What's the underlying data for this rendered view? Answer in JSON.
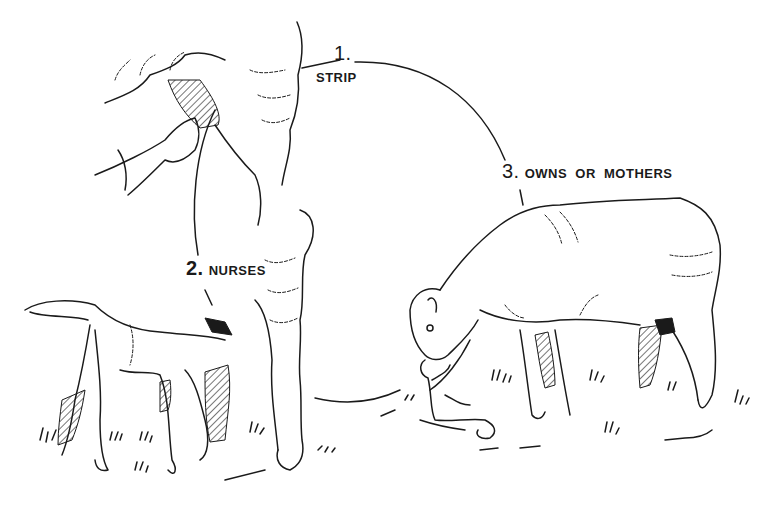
{
  "diagram": {
    "type": "cycle",
    "steps": [
      {
        "number": "1.",
        "label": "STRIP"
      },
      {
        "number": "2.",
        "label": "NURSES"
      },
      {
        "number": "3.",
        "label": "OWNS  OR  MOTHERS"
      }
    ]
  },
  "colors": {
    "ink": "#1a1a1a",
    "background": "#ffffff"
  }
}
